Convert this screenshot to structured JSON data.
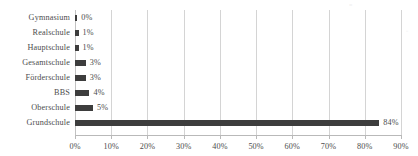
{
  "chart_data": {
    "type": "bar",
    "orientation": "horizontal",
    "title": "",
    "xlabel": "",
    "ylabel": "",
    "categories": [
      "Gymnasium",
      "Realschule",
      "Hauptschule",
      "Gesamtschule",
      "Förderschule",
      "BBS",
      "Oberschule",
      "Grundschule"
    ],
    "values": [
      0,
      1,
      1,
      3,
      3,
      4,
      5,
      84
    ],
    "value_labels": [
      "0%",
      "1%",
      "1%",
      "3%",
      "3%",
      "4%",
      "5%",
      "84%"
    ],
    "xlim": [
      0,
      90
    ],
    "xticks": [
      0,
      10,
      20,
      30,
      40,
      50,
      60,
      70,
      80,
      90
    ],
    "xtick_labels": [
      "0%",
      "10%",
      "20%",
      "30%",
      "40%",
      "50%",
      "60%",
      "70%",
      "80%",
      "90%"
    ],
    "grid": true,
    "grid_axis": "x",
    "legend": false,
    "bar_color": "#3d3d3d",
    "gridline_color": "#d4d4d4",
    "axis_color": "#b9b9b9",
    "text_color": "#4d4d4d"
  },
  "artifacts": {
    "top_speck": "≡",
    "right_speck": "▫"
  }
}
